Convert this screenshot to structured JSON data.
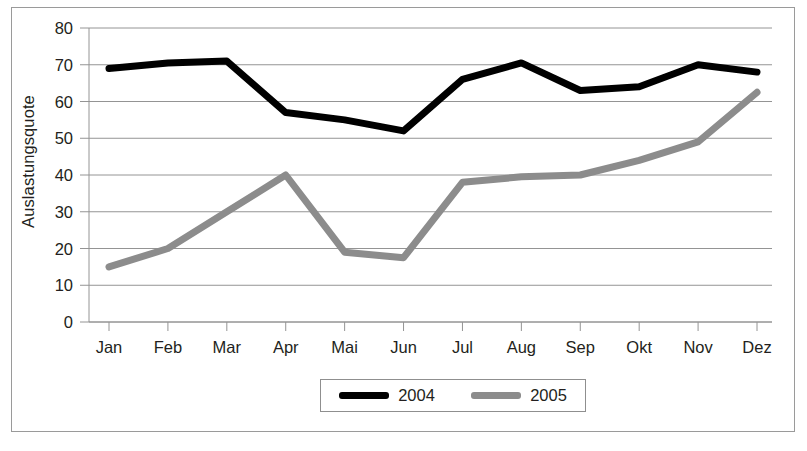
{
  "chart_data": {
    "type": "line",
    "title": "",
    "xlabel": "",
    "ylabel": "Auslastungsquote",
    "categories": [
      "Jan",
      "Feb",
      "Mar",
      "Apr",
      "Mai",
      "Jun",
      "Jul",
      "Aug",
      "Sep",
      "Okt",
      "Nov",
      "Dez"
    ],
    "series": [
      {
        "name": "2004",
        "color": "#000000",
        "values": [
          69,
          70.5,
          71,
          57,
          55,
          52,
          66,
          70.5,
          63,
          64,
          70,
          68
        ]
      },
      {
        "name": "2005",
        "color": "#8c8c8c",
        "values": [
          15,
          20,
          30,
          40,
          19,
          17.5,
          38,
          39.5,
          40,
          44,
          49,
          62.5
        ]
      }
    ],
    "ylim": [
      0,
      80
    ],
    "y_ticks": [
      0,
      10,
      20,
      30,
      40,
      50,
      60,
      70,
      80
    ],
    "y_tick_labels": [
      "0",
      "10",
      "20",
      "30",
      "40",
      "50",
      "60",
      "70",
      "80"
    ],
    "grid": true,
    "legend_position": "bottom-center"
  },
  "legend": {
    "entries": [
      {
        "label": "2004",
        "color": "#000000"
      },
      {
        "label": "2005",
        "color": "#8c8c8c"
      }
    ]
  },
  "axis": {
    "y_title": "Auslastungsquote"
  }
}
